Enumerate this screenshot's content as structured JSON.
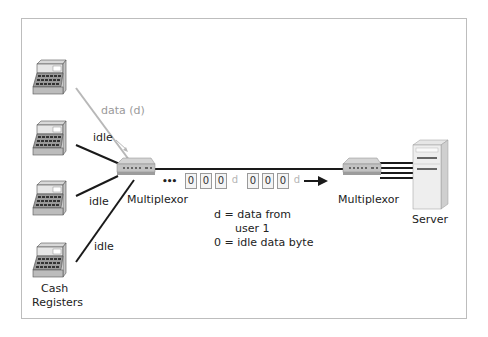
{
  "diagram": {
    "type": "statistical-multiplexing",
    "labels": {
      "data_line": "data (d)",
      "idle_1": "idle",
      "idle_2": "idle",
      "idle_3": "idle",
      "mux_left": "Multiplexor",
      "mux_right": "Multiplexor",
      "server": "Server",
      "cash_registers_line1": "Cash",
      "cash_registers_line2": "Registers",
      "ellipsis": "•••"
    },
    "legend": {
      "line1": "d = data from",
      "line2": "user 1",
      "line3": "0 = idle data byte"
    },
    "register_display": "24",
    "bytes": [
      "0",
      "0",
      "0",
      "d",
      "0",
      "0",
      "0",
      "d"
    ],
    "colors": {
      "line_dark": "#1a1a1a",
      "line_data": "#b8b8b8",
      "frame_border": "#bdbdbd",
      "data_byte_text": "#b5b5b5"
    }
  }
}
